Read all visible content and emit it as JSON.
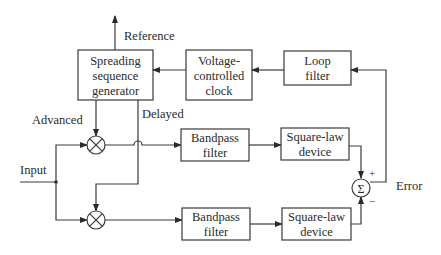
{
  "diagram": {
    "type": "block-diagram",
    "title": "",
    "blocks": {
      "spreading": {
        "lines": [
          "Spreading",
          "sequence",
          "generator"
        ]
      },
      "vcc": {
        "lines": [
          "Voltage-",
          "controlled",
          "clock"
        ]
      },
      "loop_filter": {
        "lines": [
          "Loop",
          "filter"
        ]
      },
      "bpf_upper": {
        "lines": [
          "Bandpass",
          "filter"
        ]
      },
      "bpf_lower": {
        "lines": [
          "Bandpass",
          "filter"
        ]
      },
      "sq_upper": {
        "lines": [
          "Square-law",
          "device"
        ]
      },
      "sq_lower": {
        "lines": [
          "Square-law",
          "device"
        ]
      }
    },
    "labels": {
      "reference": "Reference",
      "advanced": "Advanced",
      "delayed": "Delayed",
      "input": "Input",
      "error": "Error",
      "plus": "+",
      "minus": "−",
      "sigma": "Σ"
    },
    "colors": {
      "line": "#3a3a3a",
      "text": "#2a2a2a",
      "background": "#ffffff"
    }
  }
}
